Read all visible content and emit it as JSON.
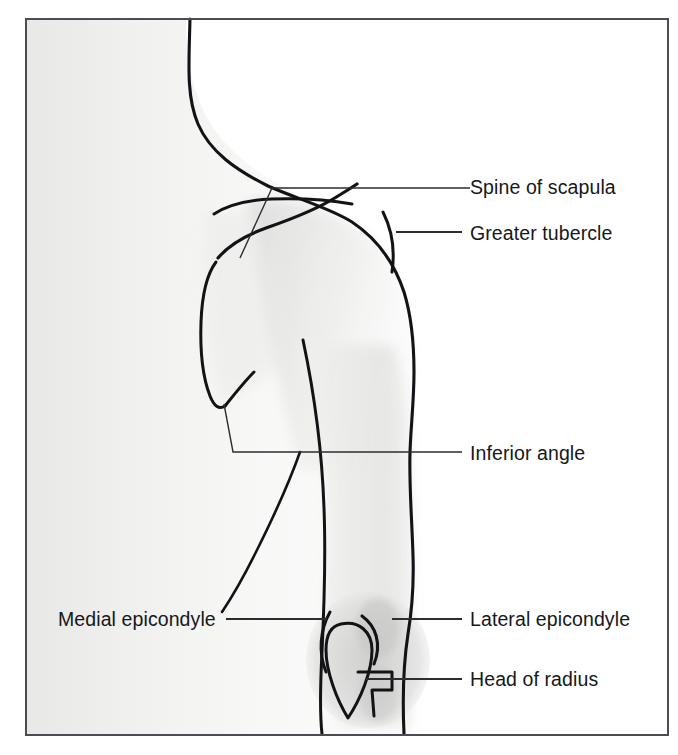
{
  "figure": {
    "frame": {
      "x": 25,
      "y": 18,
      "width": 643,
      "height": 717,
      "stroke_color": "#4a4d52"
    },
    "background_color": "#ffffff",
    "ink_color": "#111315",
    "shading_color": "#d8d8d6"
  },
  "labels": [
    {
      "id": "spine-of-scapula",
      "text": "Spine of scapula",
      "text_x": 470,
      "text_y": 194,
      "anchor": "start",
      "leader_path": "M 470 188 L 272 188 L 240 258",
      "target": "scapular spine"
    },
    {
      "id": "greater-tubercle",
      "text": "Greater tubercle",
      "text_x": 470,
      "text_y": 240,
      "anchor": "start",
      "leader_path": "M 462 232 L 396 232",
      "target": "greater tubercle of humerus"
    },
    {
      "id": "inferior-angle",
      "text": "Inferior angle",
      "text_x": 470,
      "text_y": 460,
      "anchor": "start",
      "leader_path": "M 462 452 L 233 452 L 224 404",
      "target": "inferior angle of scapula"
    },
    {
      "id": "medial-epicondyle",
      "text": "Medial epicondyle",
      "text_x": 58,
      "text_y": 626,
      "anchor": "start",
      "leader_path": "M 226 619 L 327 619",
      "target": "medial epicondyle of humerus"
    },
    {
      "id": "lateral-epicondyle",
      "text": "Lateral epicondyle",
      "text_x": 470,
      "text_y": 626,
      "anchor": "start",
      "leader_path": "M 462 619 L 392 619",
      "target": "lateral epicondyle of humerus"
    },
    {
      "id": "head-of-radius",
      "text": "Head of radius",
      "text_x": 470,
      "text_y": 686,
      "anchor": "start",
      "leader_path": "M 462 679 L 366 679",
      "target": "head of radius"
    }
  ],
  "anatomy_parts": [
    {
      "id": "neck-shoulder-contour",
      "name": "neck and shoulder contour"
    },
    {
      "id": "arm-lateral-contour",
      "name": "lateral contour of arm"
    },
    {
      "id": "arm-medial-contour",
      "name": "medial contour of arm"
    },
    {
      "id": "torso-edge",
      "name": "torso edge"
    },
    {
      "id": "scapula-outline",
      "name": "scapula outline"
    },
    {
      "id": "scapular-spine",
      "name": "spine of scapula"
    },
    {
      "id": "greater-tubercle-mark",
      "name": "greater tubercle landmark"
    },
    {
      "id": "olecranon",
      "name": "olecranon"
    },
    {
      "id": "medial-epicondyle-arc",
      "name": "medial epicondyle arc"
    },
    {
      "id": "lateral-epicondyle-arc",
      "name": "lateral epicondyle arc"
    },
    {
      "id": "radius-head-mark",
      "name": "head of radius landmark"
    }
  ]
}
